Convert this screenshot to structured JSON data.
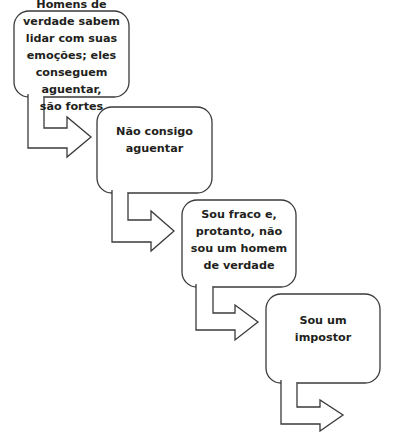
{
  "diagram": {
    "type": "flowchart",
    "stroke_color": "#3a3a3a",
    "fill_color": "#ffffff",
    "text_color": "#231f20",
    "boxes": [
      {
        "id": "box-1",
        "text": "Homens de\nverdade sabem\nlidar com suas\nemoções; eles\nconseguem aguentar,\nsão fortes"
      },
      {
        "id": "box-2",
        "text": "Não consigo\naguentar"
      },
      {
        "id": "box-3",
        "text": "Sou fraco e,\nprotanto, não\nsou um homem\nde verdade"
      },
      {
        "id": "box-4",
        "text": "Sou um\nimpostor"
      }
    ],
    "arrows": [
      {
        "from": "box-1",
        "to": "box-2"
      },
      {
        "from": "box-2",
        "to": "box-3"
      },
      {
        "from": "box-3",
        "to": "box-4"
      },
      {
        "from": "box-4",
        "to": ""
      }
    ]
  }
}
